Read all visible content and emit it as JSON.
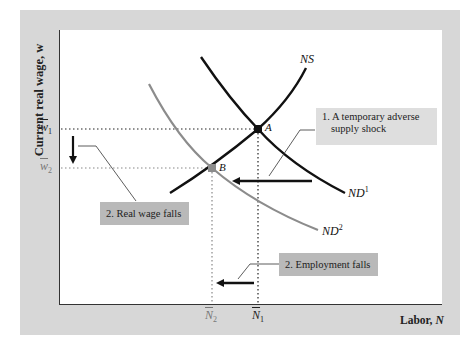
{
  "figure": {
    "y_axis_label": "Current real wage, w",
    "x_axis_label_text": "Labor, ",
    "x_axis_label_var": "N",
    "y_ticks": [
      {
        "label": "w̅₁",
        "base": "w",
        "sub": "1",
        "y_px": 129,
        "style": "black"
      },
      {
        "label": "w̅₂",
        "base": "w",
        "sub": "2",
        "y_px": 168,
        "style": "gray"
      }
    ],
    "x_ticks": [
      {
        "label": "N̅₂",
        "base": "N",
        "sub": "2",
        "x_px": 212,
        "style": "gray"
      },
      {
        "label": "N̅₁",
        "base": "N",
        "sub": "1",
        "x_px": 258,
        "style": "black"
      }
    ],
    "curves": [
      {
        "id": "NS",
        "label": "NS",
        "sup": "",
        "color": "#111111",
        "description": "labor supply, upward sloping"
      },
      {
        "id": "ND1",
        "label": "ND",
        "sup": "1",
        "color": "#111111",
        "description": "initial labor demand, downward sloping"
      },
      {
        "id": "ND2",
        "label": "ND",
        "sup": "2",
        "color": "#8c8c8c",
        "description": "labor demand after shock, shifted left"
      }
    ],
    "points": [
      {
        "label": "A",
        "x_px": 258,
        "y_px": 129,
        "color": "#111111"
      },
      {
        "label": "B",
        "x_px": 212,
        "y_px": 168,
        "color": "#8c8c8c"
      }
    ],
    "callouts": {
      "shock": {
        "line1": "1. A temporary adverse",
        "line2": "supply shock"
      },
      "wage": {
        "text": "2. Real wage falls"
      },
      "employment": {
        "text": "2. Employment falls"
      }
    },
    "colors": {
      "frame": "#d7d7d7",
      "plot_bg": "#ffffff",
      "primary": "#111111",
      "shifted": "#8c8c8c",
      "callout_light": "#dedede",
      "callout_dark": "#b9b9b9"
    }
  }
}
